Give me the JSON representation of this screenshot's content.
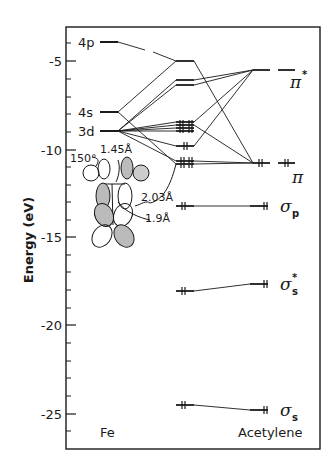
{
  "axis": {
    "ylabel": "Energy (eV)",
    "ticks": [
      "-5",
      "-10",
      "-15",
      "-20",
      "-25"
    ],
    "tick_values": [
      -5,
      -10,
      -15,
      -20,
      -25
    ],
    "ylim": [
      -27,
      -2.5
    ],
    "minor_tick_step": 1
  },
  "columns": {
    "left": "Fe",
    "right": "Acetylene"
  },
  "fe_levels": [
    {
      "label": "4p",
      "energy": -3.9
    },
    {
      "label": "4s",
      "energy": -7.9
    },
    {
      "label": "3d",
      "energy": -9.0
    }
  ],
  "acetylene_levels": [
    {
      "label": "π",
      "sup": "*",
      "sub": "",
      "energy": -5.5
    },
    {
      "label": "π",
      "sup": "",
      "sub": "",
      "energy": -10.8
    },
    {
      "label": "σ",
      "sup": "",
      "sub": "p",
      "energy": -13.3
    },
    {
      "label": "σ",
      "sup": "*",
      "sub": "s",
      "energy": -17.6
    },
    {
      "label": "σ",
      "sup": "",
      "sub": "s",
      "energy": -24.8
    }
  ],
  "complex_levels_ev": [
    -5.0,
    -6.1,
    -6.4,
    -8.6,
    -8.8,
    -9.0,
    -9.2,
    -10.0,
    -10.8,
    -11.0,
    -13.3,
    -18.0,
    -24.5
  ],
  "structure_annotations": {
    "angle": "150°",
    "bond_cc": "1.45Å",
    "bond_fec": "2.03Å",
    "bond_fe": "1.9Å"
  },
  "electron_pair_marker": "‖"
}
